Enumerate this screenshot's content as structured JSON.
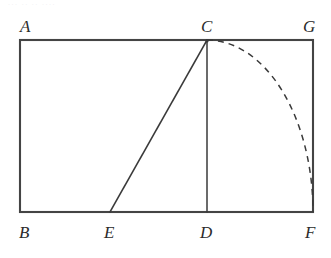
{
  "figure": {
    "kind": "geometry-diagram",
    "canvas": {
      "width": 331,
      "height": 258,
      "background": "#ffffff"
    },
    "colors": {
      "stroke": "#3a3a3a",
      "rectangle_stroke": "#444444",
      "arc_stroke": "#3a3a3a",
      "label_text": "#2b2b2b",
      "artifact_text": "#cfcfd6"
    },
    "stroke_widths": {
      "rectangle": 2.1,
      "segment": 1.5,
      "arc": 1.5
    },
    "points": [
      {
        "id": "A",
        "label": "A",
        "x": 20,
        "y": 40,
        "label_x": 20,
        "label_y": 18,
        "label_anchor": "below-right-of-label"
      },
      {
        "id": "C",
        "label": "C",
        "x": 207,
        "y": 40,
        "label_x": 201,
        "label_y": 18
      },
      {
        "id": "G",
        "label": "G",
        "x": 313,
        "y": 40,
        "label_x": 303,
        "label_y": 18
      },
      {
        "id": "B",
        "label": "B",
        "x": 20,
        "y": 212,
        "label_x": 19,
        "label_y": 224
      },
      {
        "id": "E",
        "label": "E",
        "x": 110,
        "y": 212,
        "label_x": 104,
        "label_y": 224
      },
      {
        "id": "D",
        "label": "D",
        "x": 207,
        "y": 212,
        "label_x": 200,
        "label_y": 224
      },
      {
        "id": "F",
        "label": "F",
        "x": 313,
        "y": 212,
        "label_x": 305,
        "label_y": 224
      }
    ],
    "rectangle": {
      "name": "ABFG",
      "x": 20,
      "y": 40,
      "width": 293,
      "height": 172,
      "corners": [
        "A",
        "G",
        "F",
        "B"
      ]
    },
    "segments": [
      {
        "id": "CD",
        "from": "C",
        "to": "E_vertical",
        "x1": 207,
        "y1": 40,
        "x2": 207,
        "y2": 212,
        "style": "solid"
      },
      {
        "id": "CE",
        "from": "C",
        "to": "E",
        "x1": 207,
        "y1": 40,
        "x2": 110,
        "y2": 212,
        "style": "solid"
      }
    ],
    "arc": {
      "id": "arc-CF",
      "from": "C",
      "to": "F",
      "style": "dashed",
      "dash_pattern": "6 5",
      "start_x": 207,
      "start_y": 40,
      "end_x": 313,
      "end_y": 212,
      "rx": 106,
      "ry": 172,
      "sweep": 1,
      "large_arc": 0
    },
    "artifact_text": "···  ··  ·· ····"
  }
}
